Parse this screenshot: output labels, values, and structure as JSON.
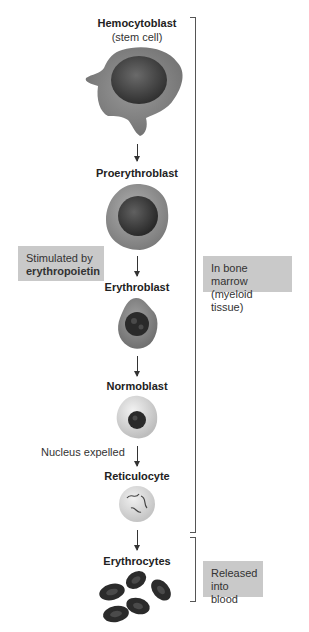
{
  "stages": [
    {
      "name": "Hemocytoblast",
      "subtitle": "(stem cell)"
    },
    {
      "name": "Proerythroblast"
    },
    {
      "name": "Erythroblast"
    },
    {
      "name": "Normoblast"
    },
    {
      "name": "Reticulocyte"
    },
    {
      "name": "Erythrocytes"
    }
  ],
  "annotations": {
    "stimulus_line1": "Stimulated by",
    "stimulus_line2": "erythropoietin",
    "nucleus": "Nucleus expelled",
    "marrow_line1": "In bone marrow",
    "marrow_line2": "(myeloid tissue)",
    "blood_line1": "Released",
    "blood_line2": "into blood"
  },
  "colors": {
    "cell_gray": "#8a8a8a",
    "nucleus_dark": "#3a3a3a",
    "label_box": "#c9c9c9",
    "erythrocyte": "#2b2b2b"
  }
}
